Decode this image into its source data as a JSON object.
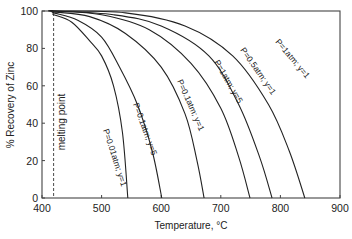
{
  "chart_data": {
    "type": "line",
    "title": "",
    "xlabel": "Temperature, °C",
    "ylabel": "% Recovery of Zinc",
    "xlim": [
      400,
      900
    ],
    "ylim": [
      0,
      100
    ],
    "xticks": [
      400,
      500,
      600,
      700,
      800,
      900
    ],
    "yticks": [
      0,
      20,
      40,
      60,
      80,
      100
    ],
    "grid": false,
    "legend": "none (curves labeled inline)",
    "annotations": [
      {
        "text": "melting point",
        "x": 419.5,
        "style": "dashed vertical line"
      }
    ],
    "series": [
      {
        "name": "P=0.01atm; y=1",
        "x": [
          420,
          450,
          480,
          500,
          520,
          535,
          544
        ],
        "y": [
          98,
          94,
          84,
          76,
          60,
          35,
          0
        ]
      },
      {
        "name": "P=0.1atm; y=5",
        "x": [
          420,
          460,
          500,
          530,
          560,
          585,
          601
        ],
        "y": [
          99,
          95,
          86,
          70,
          50,
          25,
          0
        ]
      },
      {
        "name": "P=0.1atm; y=1",
        "x": [
          420,
          480,
          540,
          600,
          640,
          660,
          672
        ],
        "y": [
          99.5,
          97,
          88,
          70,
          45,
          20,
          0
        ]
      },
      {
        "name": "P=1atm; y=5",
        "x": [
          420,
          500,
          580,
          650,
          700,
          730,
          749
        ],
        "y": [
          100,
          98,
          90,
          72,
          48,
          22,
          0
        ]
      },
      {
        "name": "P=0.5atm; y=1",
        "x": [
          420,
          520,
          600,
          680,
          730,
          765,
          786
        ],
        "y": [
          100,
          98,
          92,
          76,
          50,
          22,
          0
        ]
      },
      {
        "name": "P=1atm; y=1",
        "x": [
          420,
          540,
          640,
          720,
          780,
          815,
          841
        ],
        "y": [
          100,
          99,
          92,
          76,
          50,
          25,
          0
        ]
      }
    ]
  },
  "labels": {
    "xlabel": "Temperature, °C",
    "ylabel": "% Recovery of Zinc",
    "melting_point": "melting point",
    "curves": [
      "P=0.01atm; y=1",
      "P=0.1atm; y=5",
      "P=0.1atm; y=1",
      "P=1atm; y=5",
      "P=0.5atm; y=1",
      "P=1atm; y=1"
    ]
  }
}
